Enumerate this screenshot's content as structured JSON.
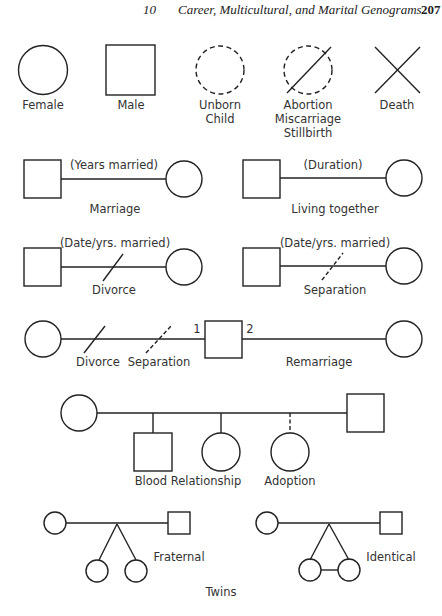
{
  "header": {
    "chapter_number": "10",
    "chapter_title": "Career, Multicultural, and Marital Genograms",
    "page_number": "207"
  },
  "symbols": [
    {
      "name": "female",
      "label": "Female",
      "shape": "circle"
    },
    {
      "name": "male",
      "label": "Male",
      "shape": "square"
    },
    {
      "name": "unborn-child",
      "label_line1": "Unborn",
      "label_line2": "Child",
      "shape": "dashed-circle"
    },
    {
      "name": "abortion",
      "label_line1": "Abortion",
      "label_line2": "Miscarriage",
      "label_line3": "Stillbirth",
      "shape": "dashed-circle-slash"
    },
    {
      "name": "death",
      "label": "Death",
      "shape": "x-cross"
    }
  ],
  "relationships": {
    "marriage": {
      "annotation": "(Years married)",
      "label": "Marriage"
    },
    "living_together": {
      "annotation": "(Duration)",
      "label": "Living together"
    },
    "divorce": {
      "annotation": "(Date/yrs. married)",
      "label": "Divorce"
    },
    "separation": {
      "annotation": "(Date/yrs. married)",
      "label": "Separation"
    },
    "remarriage": {
      "divorce_label": "Divorce",
      "separation_label": "Separation",
      "order_1": "1",
      "order_2": "2",
      "label": "Remarriage"
    },
    "children": {
      "blood_label": "Blood Relationship",
      "adoption_label": "Adoption"
    },
    "twins": {
      "fraternal_label": "Fraternal",
      "identical_label": "Identical",
      "caption": "Twins"
    }
  },
  "colors": {
    "stroke": "#222222",
    "background": "#ffffff",
    "text": "#333333"
  }
}
